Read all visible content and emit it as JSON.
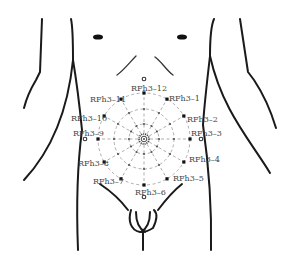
{
  "figure": {
    "type": "abdominal acupoint diagram",
    "center": {
      "x": 144,
      "y": 139
    },
    "rings_radius": [
      15,
      30,
      46
    ],
    "spoke_count": 12,
    "colors": {
      "outline": "#1a1a1a",
      "grid": "#9a9a9a",
      "label": "#444444",
      "point": "#111111"
    }
  },
  "points": [
    {
      "id": "RFh3-1",
      "label": "RFh3–1",
      "angle_deg": 30
    },
    {
      "id": "RFh3-2",
      "label": "RFh3–2",
      "angle_deg": 60
    },
    {
      "id": "RFh3-3",
      "label": "RFh3–3",
      "angle_deg": 90
    },
    {
      "id": "RFh3-4",
      "label": "RFh3–4",
      "angle_deg": 120
    },
    {
      "id": "RFh3-5",
      "label": "RFh3–5",
      "angle_deg": 150
    },
    {
      "id": "RFh3-6",
      "label": "RFh3–6",
      "angle_deg": 180
    },
    {
      "id": "RFh3-7",
      "label": "RFh3–7",
      "angle_deg": 210
    },
    {
      "id": "RFh3-8",
      "label": "RFh3–8",
      "angle_deg": 240
    },
    {
      "id": "RFh3-9",
      "label": "RFh3–9",
      "angle_deg": 270
    },
    {
      "id": "RFh3-10",
      "label": "RFh3–10",
      "angle_deg": 300
    },
    {
      "id": "RFh3-11",
      "label": "RFh3–11",
      "angle_deg": 330
    },
    {
      "id": "RFh3-12",
      "label": "RFh3–12",
      "angle_deg": 0
    }
  ],
  "labels": {
    "p1": "RFh3–1",
    "p2": "RFh3–2",
    "p3": "RFh3–3",
    "p4": "RFh3–4",
    "p5": "RFh3–5",
    "p6": "RFh3–6",
    "p7": "RFh3–7",
    "p8": "RFh3–8",
    "p9": "RFh3–9",
    "p10": "RFh3–10",
    "p11": "RFh3–11",
    "p12": "RFh3–12"
  },
  "landmarks": [
    "left-nipple",
    "right-nipple",
    "rib-cage-arch",
    "navel",
    "groin",
    "genitals",
    "arms"
  ]
}
